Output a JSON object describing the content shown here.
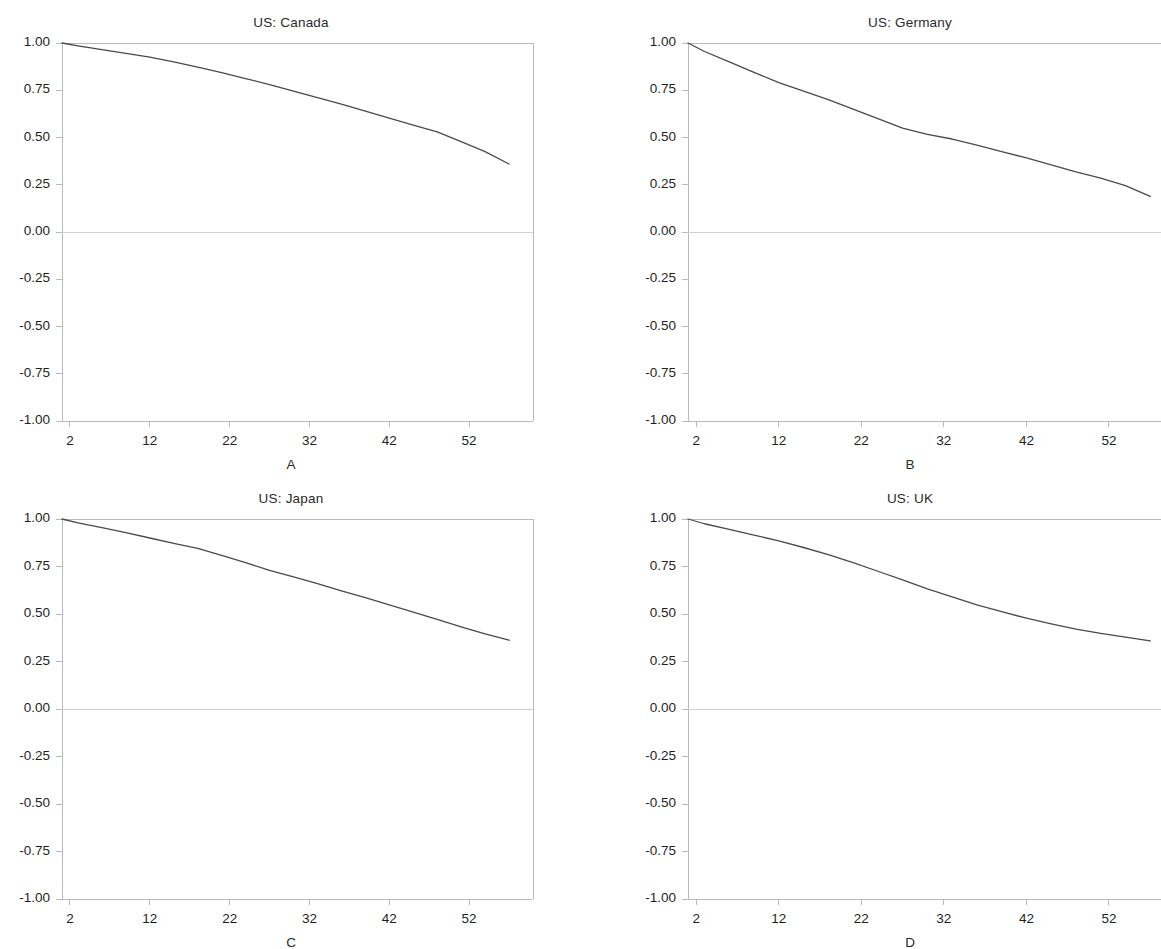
{
  "figure": {
    "background": "#ffffff",
    "line_color": "#4a4a4a",
    "axis_color": "#b9b9b9",
    "zero_line_color": "#d0d0d0",
    "text_color": "#1f1f1f"
  },
  "axes": {
    "y_ticks": [
      "1.00",
      "0.75",
      "0.50",
      "0.25",
      "0.00",
      "-0.25",
      "-0.50",
      "-0.75",
      "-1.00"
    ],
    "y_tick_values": [
      1.0,
      0.75,
      0.5,
      0.25,
      0.0,
      -0.25,
      -0.5,
      -0.75,
      -1.0
    ],
    "x_ticks": [
      "2",
      "12",
      "22",
      "32",
      "42",
      "52"
    ],
    "x_tick_values": [
      2,
      12,
      22,
      32,
      42,
      52
    ],
    "ylim": [
      -1.0,
      1.0
    ],
    "xlim": [
      1,
      60
    ],
    "grid": false,
    "zero_line": true
  },
  "chart_data": [
    {
      "type": "line",
      "title": "US: Canada",
      "xlabel": "A",
      "ylabel": "",
      "ylim": [
        -1.0,
        1.0
      ],
      "xlim": [
        1,
        60
      ],
      "x": [
        1,
        3,
        6,
        9,
        12,
        15,
        18,
        21,
        24,
        27,
        30,
        33,
        36,
        39,
        42,
        45,
        48,
        51,
        54,
        57
      ],
      "values": [
        1.0,
        0.985,
        0.965,
        0.945,
        0.925,
        0.9,
        0.872,
        0.843,
        0.812,
        0.78,
        0.746,
        0.711,
        0.676,
        0.64,
        0.603,
        0.566,
        0.53,
        0.478,
        0.425,
        0.36
      ]
    },
    {
      "type": "line",
      "title": "US: Germany",
      "xlabel": "B",
      "ylabel": "",
      "ylim": [
        -1.0,
        1.0
      ],
      "xlim": [
        1,
        60
      ],
      "x": [
        1,
        3,
        6,
        9,
        12,
        15,
        18,
        21,
        24,
        27,
        30,
        33,
        36,
        39,
        42,
        45,
        48,
        51,
        54,
        57
      ],
      "values": [
        1.0,
        0.955,
        0.9,
        0.845,
        0.79,
        0.745,
        0.7,
        0.65,
        0.6,
        0.55,
        0.517,
        0.492,
        0.46,
        0.425,
        0.392,
        0.355,
        0.318,
        0.285,
        0.245,
        0.188
      ]
    },
    {
      "type": "line",
      "title": "US: Japan",
      "xlabel": "C",
      "ylabel": "",
      "ylim": [
        -1.0,
        1.0
      ],
      "xlim": [
        1,
        60
      ],
      "x": [
        1,
        3,
        6,
        9,
        12,
        15,
        18,
        21,
        24,
        27,
        30,
        33,
        36,
        39,
        42,
        45,
        48,
        51,
        54,
        57
      ],
      "values": [
        1.0,
        0.98,
        0.955,
        0.928,
        0.9,
        0.872,
        0.845,
        0.808,
        0.77,
        0.73,
        0.695,
        0.66,
        0.622,
        0.586,
        0.548,
        0.51,
        0.472,
        0.432,
        0.395,
        0.362
      ]
    },
    {
      "type": "line",
      "title": "US: UK",
      "xlabel": "D",
      "ylabel": "",
      "ylim": [
        -1.0,
        1.0
      ],
      "xlim": [
        1,
        60
      ],
      "x": [
        1,
        3,
        6,
        9,
        12,
        15,
        18,
        21,
        24,
        27,
        30,
        33,
        36,
        39,
        42,
        45,
        48,
        51,
        54,
        57
      ],
      "values": [
        1.0,
        0.975,
        0.945,
        0.915,
        0.885,
        0.85,
        0.812,
        0.77,
        0.725,
        0.68,
        0.632,
        0.59,
        0.548,
        0.512,
        0.478,
        0.448,
        0.42,
        0.398,
        0.378,
        0.358
      ]
    }
  ]
}
